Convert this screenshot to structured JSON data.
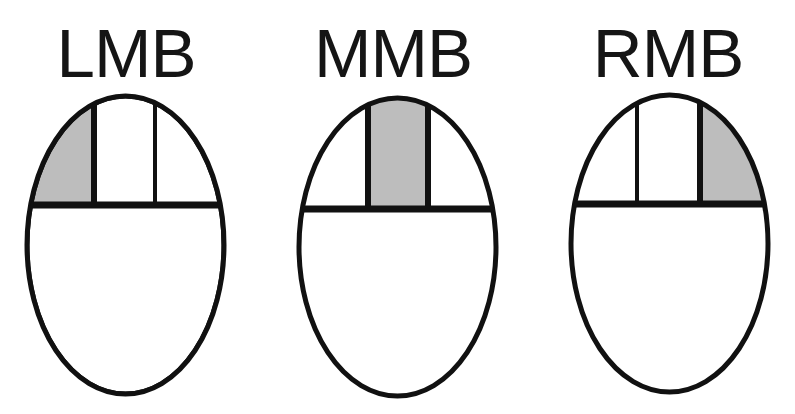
{
  "labels": {
    "left": "LMB",
    "middle": "MMB",
    "right": "RMB"
  },
  "colors": {
    "outline": "#111111",
    "highlight": "#bdbdbd",
    "background": "#ffffff"
  },
  "mice": [
    {
      "name": "left-mouse-button",
      "highlighted_button": "left"
    },
    {
      "name": "middle-mouse-button",
      "highlighted_button": "middle"
    },
    {
      "name": "right-mouse-button",
      "highlighted_button": "right"
    }
  ]
}
